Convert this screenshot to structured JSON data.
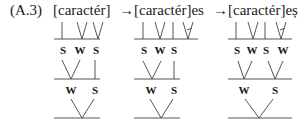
{
  "example": {
    "label": "(A.3)",
    "forms": [
      "[caractér]",
      "[caractér]es",
      "[caractér]eș"
    ],
    "arrows": [
      "→",
      "→"
    ]
  },
  "trees": [
    {
      "row1_labels": [
        "S",
        "W",
        "S"
      ],
      "row2_labels": [
        "W",
        "S"
      ]
    },
    {
      "row1_labels": [
        "S",
        "W",
        "S"
      ],
      "row2_labels": [
        "W",
        "S"
      ]
    },
    {
      "row1_labels": [
        "S",
        "W",
        "S",
        "W"
      ],
      "row2_labels": [
        "W",
        "S"
      ]
    }
  ],
  "colors": {
    "ink": "#1a1a1a",
    "line": "#555555"
  }
}
